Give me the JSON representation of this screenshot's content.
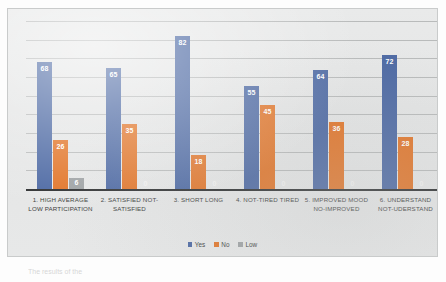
{
  "chart_data": {
    "type": "bar",
    "title": "",
    "subtitle": "",
    "xlabel": "",
    "ylabel": "",
    "ylim": [
      0,
      90
    ],
    "grid": true,
    "legend_position": "bottom",
    "categories": [
      "1. HIGH AVERAGE LOW PARTICIPATION",
      "2. SATISFIED NOT-SATISFIED",
      "3. SHORT LONG",
      "4. NOT-TIRED TIRED",
      "5. IMPROVED MOOD NO-IMPROVED",
      "6. UNDERSTAND NOT-UDERSTAND"
    ],
    "series": [
      {
        "name": "Yes",
        "color": "#4e6aa4",
        "values": [
          68,
          65,
          82,
          55,
          64,
          72
        ]
      },
      {
        "name": "No",
        "color": "#e2762a",
        "values": [
          26,
          35,
          18,
          45,
          36,
          28
        ]
      },
      {
        "name": "Low",
        "color": "#9fa3a5",
        "values": [
          6,
          0,
          0,
          0,
          0,
          0
        ]
      }
    ],
    "gridline_values": [
      10,
      20,
      30,
      40,
      50,
      60,
      70,
      80,
      90
    ]
  },
  "legend": {
    "items": [
      {
        "label": "Yes",
        "color": "#4e6aa4"
      },
      {
        "label": "No",
        "color": "#e2762a"
      },
      {
        "label": "Low",
        "color": "#9fa3a5"
      }
    ]
  },
  "caption": {
    "fragment": "The results of the"
  }
}
